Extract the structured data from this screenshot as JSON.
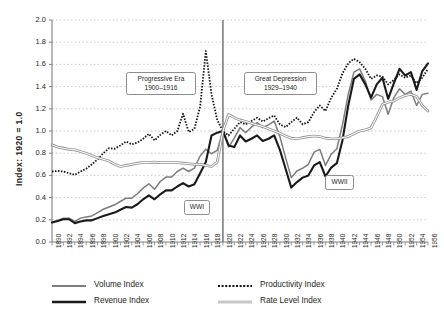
{
  "chart_data": {
    "type": "line",
    "title": "",
    "xlabel": "",
    "ylabel": "Index: 1920 = 1.0",
    "xlim": [
      1890,
      1956
    ],
    "ylim": [
      0.0,
      2.0
    ],
    "grid": true,
    "legend_position": "bottom",
    "ytick_labels": [
      "0.0",
      "0.2",
      "0.4",
      "0.6",
      "0.8",
      "1.0",
      "1.2",
      "1.4",
      "1.6",
      "1.8",
      "2.0"
    ],
    "ytick_values": [
      0.0,
      0.2,
      0.4,
      0.6,
      0.8,
      1.0,
      1.2,
      1.4,
      1.6,
      1.8,
      2.0
    ],
    "xtick_labels": [
      "1890",
      "1892",
      "1894",
      "1896",
      "1898",
      "1900",
      "1902",
      "1904",
      "1906",
      "1908",
      "1910",
      "1912",
      "1914",
      "1916",
      "1918",
      "1920",
      "1922",
      "1924",
      "1926",
      "1928",
      "1930",
      "1932",
      "1934",
      "1936",
      "1938",
      "1940",
      "1942",
      "1944",
      "1946",
      "1948",
      "1950",
      "1952",
      "1954",
      "1956"
    ],
    "xtick_values": [
      1890,
      1892,
      1894,
      1896,
      1898,
      1900,
      1902,
      1904,
      1906,
      1908,
      1910,
      1912,
      1914,
      1916,
      1918,
      1920,
      1922,
      1924,
      1926,
      1928,
      1930,
      1932,
      1934,
      1936,
      1938,
      1940,
      1942,
      1944,
      1946,
      1948,
      1950,
      1952,
      1954,
      1956
    ],
    "x": [
      1890,
      1891,
      1892,
      1893,
      1894,
      1895,
      1896,
      1897,
      1898,
      1899,
      1900,
      1901,
      1902,
      1903,
      1904,
      1905,
      1906,
      1907,
      1908,
      1909,
      1910,
      1911,
      1912,
      1913,
      1914,
      1915,
      1916,
      1917,
      1918,
      1919,
      1920,
      1921,
      1922,
      1923,
      1924,
      1925,
      1926,
      1927,
      1928,
      1929,
      1930,
      1931,
      1932,
      1933,
      1934,
      1935,
      1936,
      1937,
      1938,
      1939,
      1940,
      1941,
      1942,
      1943,
      1944,
      1945,
      1946,
      1947,
      1948,
      1949,
      1950,
      1951,
      1952,
      1953,
      1954,
      1955,
      1956
    ],
    "series": [
      {
        "name": "Volume Index",
        "color": "#7d7d7d",
        "style": "solid",
        "width": 1.5,
        "values": [
          0.175,
          0.195,
          0.215,
          0.215,
          0.185,
          0.215,
          0.225,
          0.235,
          0.265,
          0.295,
          0.315,
          0.335,
          0.365,
          0.395,
          0.395,
          0.435,
          0.485,
          0.525,
          0.475,
          0.545,
          0.585,
          0.585,
          0.635,
          0.665,
          0.635,
          0.665,
          0.775,
          0.835,
          0.795,
          0.825,
          1.0,
          0.855,
          0.935,
          1.03,
          0.985,
          1.035,
          1.075,
          1.03,
          1.055,
          1.09,
          0.95,
          0.76,
          0.58,
          0.64,
          0.665,
          0.7,
          0.81,
          0.835,
          0.69,
          0.79,
          0.84,
          1.06,
          1.33,
          1.53,
          1.56,
          1.45,
          1.28,
          1.33,
          1.31,
          1.15,
          1.3,
          1.38,
          1.33,
          1.36,
          1.23,
          1.33,
          1.34
        ]
      },
      {
        "name": "Revenue Index",
        "color": "#1a1a1a",
        "style": "solid",
        "width": 2.1,
        "values": [
          0.175,
          0.19,
          0.205,
          0.205,
          0.17,
          0.185,
          0.195,
          0.195,
          0.215,
          0.235,
          0.25,
          0.265,
          0.29,
          0.315,
          0.31,
          0.34,
          0.385,
          0.42,
          0.385,
          0.43,
          0.465,
          0.465,
          0.5,
          0.53,
          0.5,
          0.52,
          0.62,
          0.72,
          0.96,
          0.985,
          1.0,
          0.87,
          0.855,
          0.96,
          0.905,
          0.93,
          0.96,
          0.91,
          0.93,
          0.96,
          0.83,
          0.66,
          0.49,
          0.54,
          0.58,
          0.6,
          0.69,
          0.72,
          0.59,
          0.67,
          0.71,
          0.92,
          1.23,
          1.47,
          1.51,
          1.42,
          1.3,
          1.42,
          1.48,
          1.29,
          1.43,
          1.56,
          1.5,
          1.53,
          1.37,
          1.54,
          1.61
        ]
      },
      {
        "name": "Productivity Index",
        "color": "#111111",
        "style": "dotted",
        "width": 1.8,
        "values": [
          0.635,
          0.64,
          0.635,
          0.62,
          0.605,
          0.635,
          0.66,
          0.7,
          0.745,
          0.8,
          0.845,
          0.84,
          0.87,
          0.905,
          0.88,
          0.895,
          0.93,
          0.975,
          0.915,
          0.965,
          1.0,
          0.96,
          1.0,
          1.155,
          0.99,
          1.02,
          1.22,
          1.72,
          1.33,
          1.1,
          1.0,
          0.96,
          1.02,
          1.08,
          1.06,
          1.09,
          1.12,
          1.085,
          1.115,
          1.14,
          1.06,
          1.035,
          1.08,
          1.12,
          1.06,
          1.08,
          1.17,
          1.23,
          1.18,
          1.3,
          1.38,
          1.52,
          1.61,
          1.65,
          1.62,
          1.56,
          1.47,
          1.5,
          1.49,
          1.42,
          1.46,
          1.51,
          1.48,
          1.5,
          1.43,
          1.48,
          1.56
        ]
      },
      {
        "name": "Rate Level Index",
        "color": "#a8a8a8",
        "style": "double",
        "width": 1.3,
        "values": [
          0.875,
          0.855,
          0.845,
          0.835,
          0.83,
          0.815,
          0.8,
          0.78,
          0.76,
          0.745,
          0.73,
          0.7,
          0.68,
          0.69,
          0.7,
          0.71,
          0.715,
          0.715,
          0.72,
          0.715,
          0.715,
          0.715,
          0.715,
          0.71,
          0.705,
          0.7,
          0.7,
          0.69,
          0.68,
          0.72,
          1.0,
          1.15,
          1.12,
          1.1,
          1.085,
          1.07,
          1.055,
          1.04,
          1.02,
          1.0,
          0.98,
          0.955,
          0.935,
          0.93,
          0.94,
          0.95,
          0.955,
          0.95,
          0.935,
          0.93,
          0.93,
          0.94,
          0.95,
          0.975,
          1.0,
          1.01,
          1.03,
          1.13,
          1.24,
          1.26,
          1.27,
          1.3,
          1.32,
          1.33,
          1.31,
          1.23,
          1.18
        ]
      }
    ],
    "annotations": [
      {
        "id": "progressive-era",
        "line1": "Progressive Era",
        "line2": "1900–1916",
        "x_px": 126,
        "y_px": 72,
        "w_px": 70,
        "h_px": 23
      },
      {
        "id": "great-depression",
        "line1": "Great Depression",
        "line2": "1929–1940",
        "x_px": 244,
        "y_px": 72,
        "w_px": 73,
        "h_px": 23
      },
      {
        "id": "wwi",
        "line1": "WWI",
        "line2": "",
        "x_px": 184,
        "y_px": 200,
        "w_px": 26,
        "h_px": 14
      },
      {
        "id": "wwii",
        "line1": "WWII",
        "line2": "",
        "x_px": 325,
        "y_px": 175,
        "w_px": 29,
        "h_px": 14
      }
    ],
    "marker_lines": [
      {
        "id": "wwi-marker",
        "year": 1920,
        "color": "#6b6b6b"
      }
    ]
  }
}
